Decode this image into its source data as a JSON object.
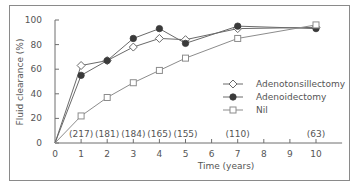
{
  "chart_data": {
    "type": "line",
    "title": "",
    "xlabel": "Time (years)",
    "ylabel": "Fluid clearance (%)",
    "xlim": [
      0,
      11
    ],
    "ylim": [
      0,
      100
    ],
    "xticks": [
      0,
      1,
      2,
      3,
      4,
      5,
      6,
      7,
      8,
      9,
      10
    ],
    "yticks": [
      0,
      20,
      40,
      60,
      80,
      100
    ],
    "grid": false,
    "legend_position": "lower right",
    "sample_sizes": [
      {
        "x": 1,
        "label": "(217)"
      },
      {
        "x": 2,
        "label": "(181)"
      },
      {
        "x": 3,
        "label": "(184)"
      },
      {
        "x": 4,
        "label": "(165)"
      },
      {
        "x": 5,
        "label": "(155)"
      },
      {
        "x": 7,
        "label": "(110)"
      },
      {
        "x": 10,
        "label": "(63)"
      }
    ],
    "series": [
      {
        "name": "Adenotonsillectomy",
        "marker": "open-diamond",
        "x": [
          0,
          1,
          2,
          3,
          4,
          5,
          7,
          10
        ],
        "values": [
          0,
          63,
          67,
          78,
          85,
          84,
          93,
          94
        ]
      },
      {
        "name": "Adenoidectomy",
        "marker": "filled-circle",
        "x": [
          0,
          1,
          2,
          3,
          4,
          5,
          7,
          10
        ],
        "values": [
          0,
          55,
          67,
          85,
          93,
          81,
          95,
          93
        ]
      },
      {
        "name": "Nil",
        "marker": "open-square",
        "x": [
          0,
          1,
          2,
          3,
          4,
          5,
          7,
          10
        ],
        "values": [
          0,
          22,
          37,
          49,
          59,
          69,
          85,
          96
        ]
      }
    ]
  },
  "colors": {
    "line": "#6a6a6a",
    "nil_line": "#8c8c8c",
    "filled_marker": "#3a3a3a",
    "open_marker_fill": "#ffffff",
    "frame": "#8a8a8a"
  }
}
